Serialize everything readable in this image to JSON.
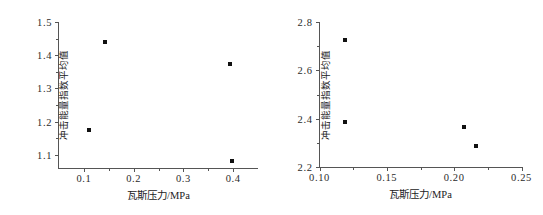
{
  "figure": {
    "panel_count": 2,
    "background_color": "#ffffff",
    "marker_color": "#111111",
    "axis_color": "#555555"
  },
  "chart_data": [
    {
      "type": "scatter",
      "panel": "left",
      "title": "",
      "xlabel": "瓦斯压力/MPa",
      "ylabel": "冲击能量指数平均值",
      "xlim": [
        0.05,
        0.45
      ],
      "ylim": [
        1.06,
        1.5
      ],
      "xticks": [
        0.1,
        0.2,
        0.3,
        0.4
      ],
      "xtick_labels": [
        "0.1",
        "0.2",
        "0.3",
        "0.4"
      ],
      "yticks": [
        1.1,
        1.2,
        1.3,
        1.4,
        1.5
      ],
      "ytick_labels": [
        "1.1",
        "1.2",
        "1.3",
        "1.4",
        "1.5"
      ],
      "x_minor_ticks": [
        0.15,
        0.25,
        0.35
      ],
      "y_minor_ticks": [
        1.15,
        1.25,
        1.35,
        1.45
      ],
      "grid": false,
      "legend": "none",
      "points": [
        {
          "x": 0.111,
          "y": 1.175
        },
        {
          "x": 0.143,
          "y": 1.44
        },
        {
          "x": 0.393,
          "y": 1.372
        },
        {
          "x": 0.398,
          "y": 1.082
        }
      ]
    },
    {
      "type": "scatter",
      "panel": "right",
      "title": "",
      "xlabel": "瓦斯压力/MPa",
      "ylabel": "冲击能量指数平均值",
      "xlim": [
        0.1,
        0.25
      ],
      "ylim": [
        2.2,
        2.8
      ],
      "xticks": [
        0.1,
        0.15,
        0.2,
        0.25
      ],
      "xtick_labels": [
        "0.10",
        "0.15",
        "0.20",
        "0.25"
      ],
      "yticks": [
        2.2,
        2.4,
        2.6,
        2.8
      ],
      "ytick_labels": [
        "2.2",
        "2.4",
        "2.6",
        "2.8"
      ],
      "x_minor_ticks": [
        0.125,
        0.175,
        0.225
      ],
      "y_minor_ticks": [
        2.3,
        2.5,
        2.7
      ],
      "grid": false,
      "legend": "none",
      "points": [
        {
          "x": 0.119,
          "y": 2.727
        },
        {
          "x": 0.119,
          "y": 2.385
        },
        {
          "x": 0.207,
          "y": 2.367
        },
        {
          "x": 0.216,
          "y": 2.288
        }
      ]
    }
  ]
}
